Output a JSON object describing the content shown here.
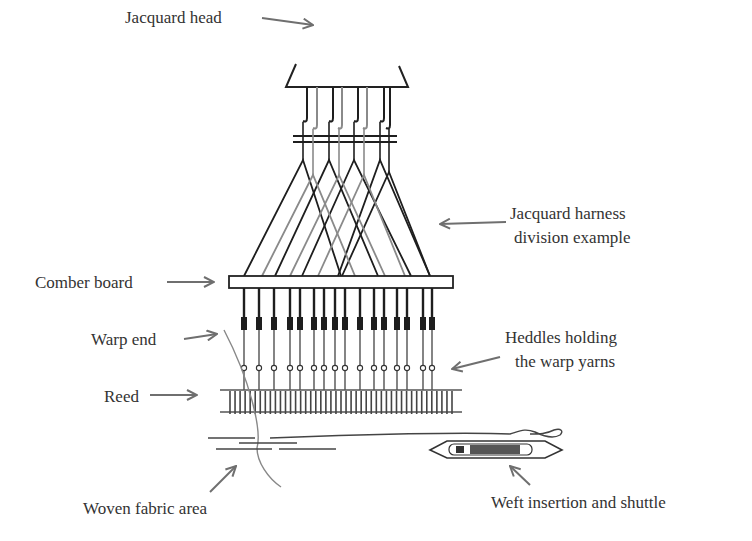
{
  "labels": {
    "jacquard_head": "Jacquard head",
    "harness_line1": "Jacquard harness",
    "harness_line2": "division example",
    "comber_board": "Comber board",
    "warp_end": "Warp end",
    "heddles_line1": "Heddles holding",
    "heddles_line2": "the warp yarns",
    "reed": "Reed",
    "woven_fabric": "Woven fabric area",
    "weft": "Weft insertion and shuttle"
  },
  "components": {
    "hooks_count": 8,
    "warp_ends_count": 16,
    "heddles_count": 16,
    "reed_dents_count": 45
  },
  "colors": {
    "line_dark": "#1e1e1e",
    "line_light": "#8a8a8a",
    "arrow": "#6f6f6f",
    "text": "#333333",
    "shuttle_bobbin": "#555555"
  }
}
